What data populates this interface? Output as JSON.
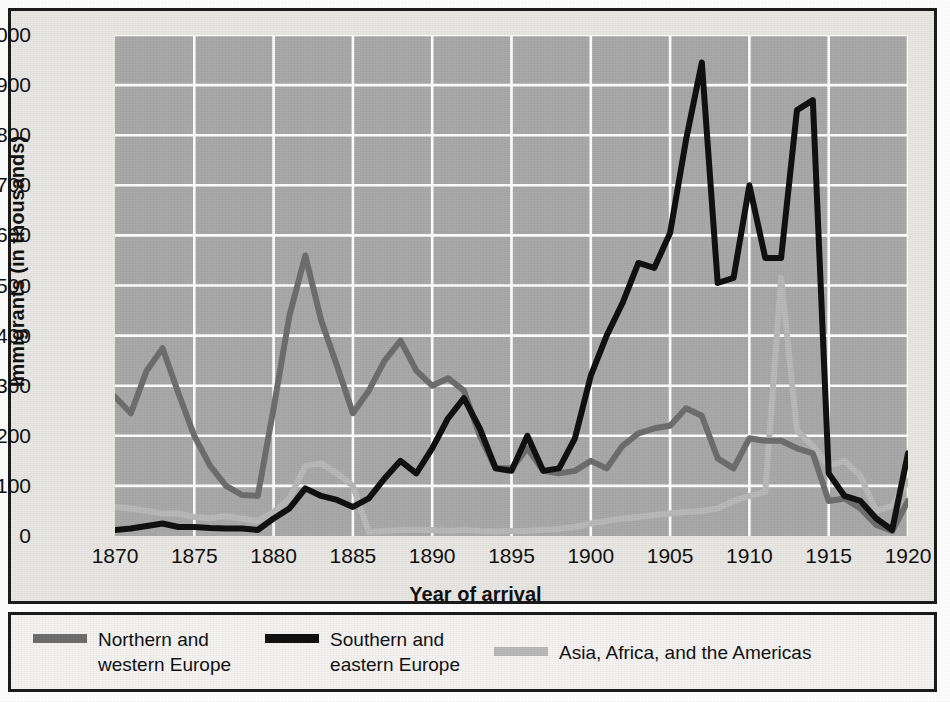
{
  "figure": {
    "background_color": "#e9e7e3",
    "plot_background_color": "#a9a9a9",
    "gridline_color": "#ffffff",
    "border_color": "#1b1b1b"
  },
  "axes": {
    "ylabel": "Immigrants (in thousands)",
    "xlabel": "Year of arrival",
    "yticks": [
      "0",
      "100",
      "200",
      "300",
      "400",
      "500",
      "600",
      "700",
      "800",
      "900",
      "1000"
    ],
    "xticks": [
      "1870",
      "1875",
      "1880",
      "1885",
      "1890",
      "1895",
      "1900",
      "1905",
      "1910",
      "1915",
      "1920"
    ]
  },
  "legend": {
    "items": [
      {
        "label": "Northern and\nwestern Europe",
        "color": "#6e6e6e",
        "name": "northern-western-europe"
      },
      {
        "label": "Southern and\neastern Europe",
        "color": "#111111",
        "name": "southern-eastern-europe"
      },
      {
        "label": "Asia, Africa, and the Americas",
        "color": "#b9b9b9",
        "name": "asia-africa-americas"
      }
    ]
  },
  "chart_data": {
    "type": "line",
    "title": "",
    "xlabel": "Year of arrival",
    "ylabel": "Immigrants (in thousands)",
    "xlim": [
      1870,
      1920
    ],
    "ylim": [
      0,
      1000
    ],
    "grid": true,
    "legend_position": "below-figure",
    "x": [
      1870,
      1871,
      1872,
      1873,
      1874,
      1875,
      1876,
      1877,
      1878,
      1879,
      1880,
      1881,
      1882,
      1883,
      1884,
      1885,
      1886,
      1887,
      1888,
      1889,
      1890,
      1891,
      1892,
      1893,
      1894,
      1895,
      1896,
      1897,
      1898,
      1899,
      1900,
      1901,
      1902,
      1903,
      1904,
      1905,
      1906,
      1907,
      1908,
      1909,
      1910,
      1911,
      1912,
      1913,
      1914,
      1915,
      1916,
      1917,
      1918,
      1919,
      1920
    ],
    "series": [
      {
        "name": "Northern and western Europe",
        "color": "#6e6e6e",
        "values": [
          278,
          245,
          330,
          375,
          285,
          200,
          140,
          100,
          82,
          80,
          255,
          440,
          560,
          430,
          340,
          245,
          290,
          350,
          390,
          330,
          300,
          315,
          290,
          200,
          135,
          135,
          175,
          130,
          125,
          130,
          150,
          135,
          180,
          205,
          215,
          220,
          255,
          240,
          155,
          135,
          195,
          190,
          190,
          175,
          165,
          70,
          75,
          55,
          22,
          10,
          70
        ]
      },
      {
        "name": "Southern and eastern Europe",
        "color": "#111111",
        "values": [
          12,
          15,
          20,
          25,
          18,
          18,
          16,
          15,
          15,
          12,
          35,
          55,
          95,
          80,
          72,
          58,
          75,
          115,
          150,
          125,
          175,
          235,
          275,
          215,
          135,
          130,
          200,
          130,
          135,
          195,
          320,
          400,
          465,
          545,
          535,
          605,
          790,
          945,
          505,
          515,
          700,
          555,
          555,
          850,
          870,
          125,
          80,
          70,
          35,
          12,
          165
        ]
      },
      {
        "name": "Asia, Africa, and the Americas",
        "color": "#b9b9b9",
        "values": [
          58,
          55,
          50,
          45,
          45,
          38,
          35,
          40,
          35,
          30,
          48,
          75,
          140,
          145,
          125,
          100,
          8,
          10,
          12,
          12,
          12,
          10,
          12,
          10,
          9,
          10,
          10,
          12,
          14,
          18,
          25,
          30,
          35,
          38,
          42,
          45,
          48,
          50,
          55,
          70,
          80,
          88,
          515,
          210,
          180,
          140,
          150,
          120,
          50,
          60,
          110
        ]
      }
    ]
  }
}
